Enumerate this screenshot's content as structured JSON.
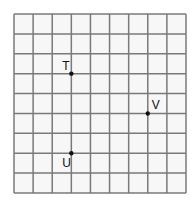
{
  "figure": {
    "type": "grid-diagram",
    "columns": 9,
    "rows": 9,
    "grid_origin_px": [
      14,
      14
    ],
    "grid_end_px": [
      186,
      193
    ],
    "line_color": "#7a7a7a",
    "background_color": "#f7f7f7",
    "point_color": "#111111"
  },
  "points": [
    {
      "label": "T",
      "col": 3,
      "row": 3,
      "label_dx": -9,
      "label_dy": -4
    },
    {
      "label": "V",
      "col": 7,
      "row": 5,
      "label_dx": 4,
      "label_dy": -4
    },
    {
      "label": "U",
      "col": 3,
      "row": 7,
      "label_dx": -9,
      "label_dy": 14
    }
  ]
}
